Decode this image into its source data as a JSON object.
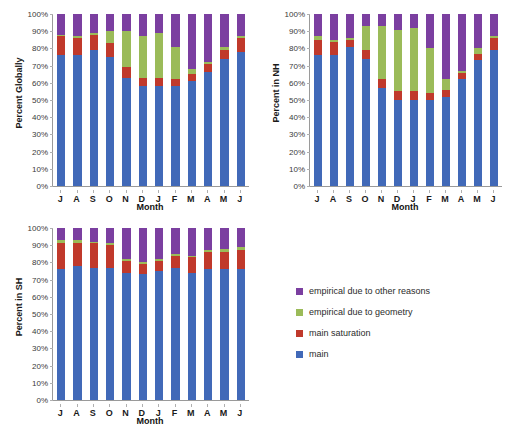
{
  "figure": {
    "background": "#ffffff",
    "series_colors": {
      "main": "#4169b8",
      "main_saturation": "#c0392b",
      "empirical_due_to_geometry": "#9bbb59",
      "empirical_due_to_other_reasons": "#7b3fa0"
    }
  },
  "legend": {
    "position": "right-bottom",
    "items": [
      {
        "label": "empirical due to other reasons",
        "color": "#7b3fa0"
      },
      {
        "label": "empirical due to geometry",
        "color": "#9bbb59"
      },
      {
        "label": "main saturation",
        "color": "#c0392b"
      },
      {
        "label": "main",
        "color": "#4169b8"
      }
    ]
  },
  "axis": {
    "yticks": [
      "100%",
      "90%",
      "80%",
      "70%",
      "60%",
      "50%",
      "40%",
      "30%",
      "20%",
      "10%",
      "0%"
    ],
    "xlabel": "Month"
  },
  "chart_data": [
    {
      "type": "bar",
      "stacked": true,
      "title": "",
      "id": "percent-globally",
      "xlabel": "Month",
      "ylabel": "Percent Globally",
      "ylim": [
        0,
        100
      ],
      "ytick_step": 10,
      "grid": false,
      "legend_position": "external-right",
      "categories": [
        "J",
        "A",
        "S",
        "O",
        "N",
        "D",
        "J",
        "F",
        "M",
        "A",
        "M",
        "J"
      ],
      "series": [
        {
          "name": "main",
          "color": "#4169b8",
          "values": [
            76,
            76,
            79,
            75,
            63,
            58,
            58,
            58,
            61,
            66,
            74,
            78
          ]
        },
        {
          "name": "main saturation",
          "color": "#c0392b",
          "values": [
            11,
            10,
            9,
            8,
            6,
            5,
            5,
            4,
            4,
            5,
            5,
            8
          ]
        },
        {
          "name": "empirical due to geometry",
          "color": "#9bbb59",
          "values": [
            1,
            1,
            1,
            7,
            21,
            24,
            26,
            19,
            3,
            1,
            2,
            1
          ]
        },
        {
          "name": "empirical due to other reasons",
          "color": "#7b3fa0",
          "values": [
            12,
            13,
            11,
            10,
            10,
            13,
            11,
            19,
            32,
            28,
            19,
            13
          ]
        }
      ]
    },
    {
      "type": "bar",
      "stacked": true,
      "title": "",
      "id": "percent-in-nh",
      "xlabel": "Month",
      "ylabel": "Percent in NH",
      "ylim": [
        0,
        100
      ],
      "ytick_step": 10,
      "grid": false,
      "legend_position": "external-right",
      "categories": [
        "J",
        "A",
        "S",
        "O",
        "N",
        "D",
        "J",
        "F",
        "M",
        "A",
        "M",
        "J"
      ],
      "series": [
        {
          "name": "main",
          "color": "#4169b8",
          "values": [
            76,
            76,
            81,
            74,
            57,
            50,
            50,
            50,
            52,
            62,
            73,
            79
          ]
        },
        {
          "name": "main saturation",
          "color": "#c0392b",
          "values": [
            9,
            8,
            4,
            5,
            5,
            5,
            5,
            4,
            4,
            4,
            4,
            7
          ]
        },
        {
          "name": "empirical due to geometry",
          "color": "#9bbb59",
          "values": [
            2,
            1,
            1,
            14,
            31,
            36,
            37,
            26,
            6,
            1,
            3,
            1
          ]
        },
        {
          "name": "empirical due to other reasons",
          "color": "#7b3fa0",
          "values": [
            13,
            15,
            14,
            7,
            7,
            9,
            8,
            20,
            38,
            33,
            20,
            13
          ]
        }
      ]
    },
    {
      "type": "bar",
      "stacked": true,
      "title": "",
      "id": "percent-in-sh",
      "xlabel": "Month",
      "ylabel": "Percent in SH",
      "ylim": [
        0,
        100
      ],
      "ytick_step": 10,
      "grid": false,
      "legend_position": "external-right",
      "categories": [
        "J",
        "A",
        "S",
        "O",
        "N",
        "D",
        "J",
        "F",
        "M",
        "A",
        "M",
        "J"
      ],
      "series": [
        {
          "name": "main",
          "color": "#4169b8",
          "values": [
            76,
            78,
            77,
            77,
            74,
            73,
            75,
            77,
            74,
            76,
            76,
            76
          ]
        },
        {
          "name": "main saturation",
          "color": "#c0392b",
          "values": [
            15,
            13,
            14,
            13,
            7,
            6,
            6,
            7,
            9,
            10,
            10,
            11
          ]
        },
        {
          "name": "empirical due to geometry",
          "color": "#9bbb59",
          "values": [
            2,
            2,
            1,
            1,
            1,
            1,
            1,
            1,
            1,
            1,
            2,
            2
          ]
        },
        {
          "name": "empirical due to other reasons",
          "color": "#7b3fa0",
          "values": [
            7,
            7,
            8,
            9,
            18,
            20,
            18,
            15,
            16,
            13,
            12,
            11
          ]
        }
      ]
    }
  ]
}
